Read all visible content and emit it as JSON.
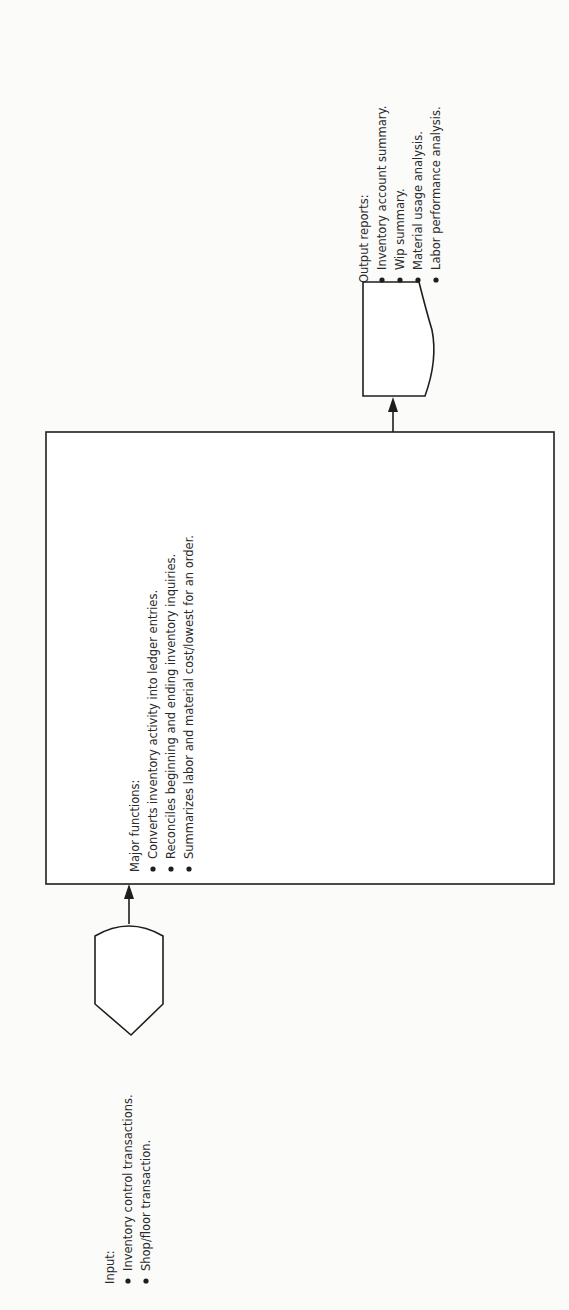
{
  "input": {
    "heading": "Input:",
    "items": [
      "Inventory control transactions.",
      "Shop/floor transaction."
    ]
  },
  "process": {
    "heading": "Major functions:",
    "items": [
      "Converts inventory activity into ledger entries.",
      "Reconciles beginning and ending inventory inquiries.",
      "Summarizes labor and material cost/lowest for an order."
    ]
  },
  "output": {
    "heading": "Output reports:",
    "items": [
      "Inventory account summary.",
      "Wip summary.",
      "Material usage analysis.",
      "Labor performance analysis."
    ]
  },
  "symbols": {
    "input_shape": "punched-card-input",
    "process_shape": "process-box",
    "output_shape": "document-output",
    "flow": [
      "input-to-process-arrow",
      "process-to-output-arrow"
    ]
  }
}
